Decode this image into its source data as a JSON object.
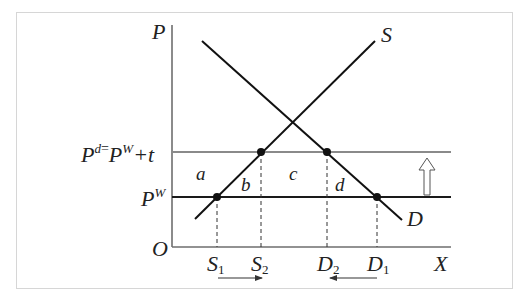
{
  "diagram": {
    "type": "tariff-effect-supply-demand",
    "axes": {
      "y_label": "P",
      "x_label": "X",
      "origin_label": "O"
    },
    "price_lines": {
      "domestic_price": {
        "label_base": "P",
        "label_sup": "d",
        "label_eq": "=",
        "label_base2": "P",
        "label_sup2": "W",
        "label_tail": "+t",
        "color": "#8a8a8a"
      },
      "world_price": {
        "label_base": "P",
        "label_sup": "W",
        "color": "#222222"
      }
    },
    "curves": {
      "supply_label": "S",
      "demand_label": "D"
    },
    "areas": {
      "a": "a",
      "b": "b",
      "c": "c",
      "d": "d"
    },
    "quantities": {
      "s1": {
        "base": "S",
        "sub": "1"
      },
      "s2": {
        "base": "S",
        "sub": "2"
      },
      "d2": {
        "base": "D",
        "sub": "2"
      },
      "d1": {
        "base": "D",
        "sub": "1"
      }
    },
    "arrows": {
      "supply_shift": "right",
      "demand_shift": "left",
      "price_shift": "up"
    },
    "colors": {
      "axis": "#6e6e6e",
      "curve": "#111111",
      "frame": "#d6d6d6"
    }
  }
}
